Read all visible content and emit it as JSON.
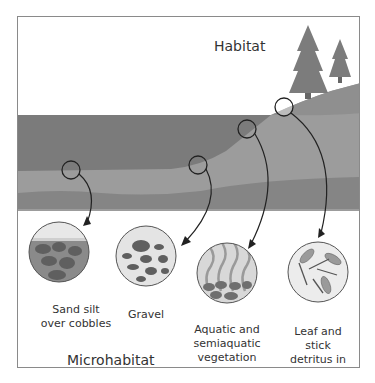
{
  "diagram": {
    "habitat_title": "Habitat",
    "microhabitat_title": "Microhabitat",
    "microhabitats": [
      {
        "id": "sand-silt",
        "label": "Sand silt\nover cobbles"
      },
      {
        "id": "gravel",
        "label": "Gravel"
      },
      {
        "id": "vegetation",
        "label": "Aquatic and\nsemiaquatic\nvegetation"
      },
      {
        "id": "detritus",
        "label": "Leaf and\nstick\ndetritus in\nmargin"
      }
    ],
    "colors": {
      "water": "#7a7a7a",
      "bank": "#9a9a9a",
      "bed": "#8a8a8a",
      "tree": "#7c7c7c",
      "rock": "#5f5f5f",
      "frame": "#8a8a8a"
    }
  }
}
